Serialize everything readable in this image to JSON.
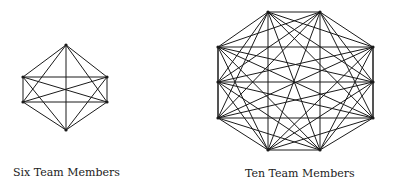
{
  "diagrams": [
    {
      "label": "Six Team Members",
      "nodes": [
        [
          66,
          45
        ],
        [
          23,
          77
        ],
        [
          107,
          77
        ],
        [
          23,
          102
        ],
        [
          107,
          102
        ],
        [
          66,
          130
        ]
      ]
    },
    {
      "label": "Ten Team Members",
      "nodes": [
        [
          268,
          12
        ],
        [
          320,
          12
        ],
        [
          218,
          47
        ],
        [
          373,
          47
        ],
        [
          218,
          82
        ],
        [
          373,
          82
        ],
        [
          218,
          118
        ],
        [
          373,
          118
        ],
        [
          268,
          150
        ],
        [
          320,
          150
        ]
      ]
    }
  ],
  "style": {
    "line_color": "#1a1a1a",
    "background": "#ffffff"
  }
}
